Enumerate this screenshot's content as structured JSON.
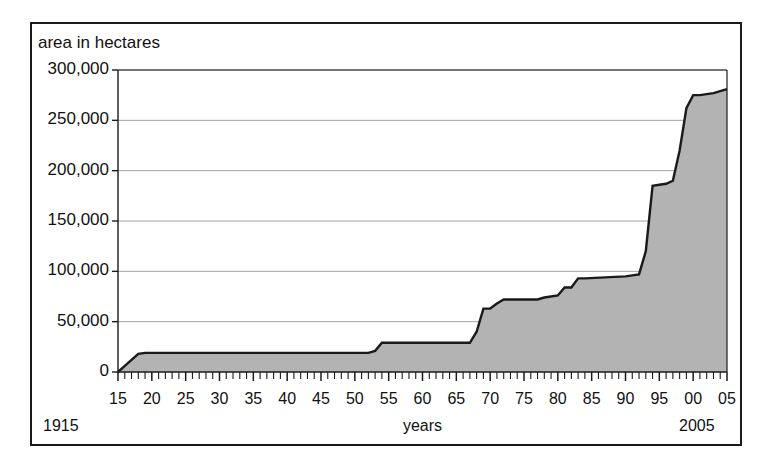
{
  "chart_data": {
    "type": "area",
    "title": "",
    "ylabel": "area in hectares",
    "xlabel": "years",
    "ylim": [
      0,
      300000
    ],
    "xlim": [
      1915,
      2005
    ],
    "grid": true,
    "legend": null,
    "y_ticks": [
      0,
      50000,
      100000,
      150000,
      200000,
      250000,
      300000
    ],
    "y_tick_labels": [
      "0",
      "50,000",
      "100,000",
      "150,000",
      "200,000",
      "250,000",
      "300,000"
    ],
    "x_ticks": [
      1915,
      1920,
      1925,
      1930,
      1935,
      1940,
      1945,
      1950,
      1955,
      1960,
      1965,
      1970,
      1975,
      1980,
      1985,
      1990,
      1995,
      2000,
      2005
    ],
    "x_tick_labels": [
      "15",
      "20",
      "25",
      "30",
      "35",
      "40",
      "45",
      "50",
      "55",
      "60",
      "65",
      "70",
      "75",
      "80",
      "85",
      "90",
      "95",
      "00",
      "05"
    ],
    "x_start_annotation": "1915",
    "x_end_annotation": "2005",
    "minor_tick_interval": 1,
    "fill_color": "#b3b3b3",
    "line_color": "#1a1a1a",
    "x": [
      1915,
      1916,
      1917,
      1918,
      1919,
      1920,
      1925,
      1930,
      1935,
      1940,
      1945,
      1950,
      1952,
      1953,
      1954,
      1960,
      1965,
      1967,
      1968,
      1969,
      1970,
      1971,
      1972,
      1975,
      1977,
      1978,
      1980,
      1981,
      1982,
      1983,
      1984,
      1990,
      1992,
      1993,
      1994,
      1995,
      1996,
      1997,
      1998,
      1999,
      2000,
      2001,
      2002,
      2003,
      2004,
      2005
    ],
    "values": [
      0,
      6000,
      12000,
      18000,
      19000,
      19000,
      19000,
      19000,
      19000,
      19000,
      19000,
      19000,
      19000,
      21000,
      29000,
      29000,
      29000,
      29000,
      40000,
      63000,
      63000,
      68000,
      72000,
      72000,
      72000,
      74000,
      76000,
      84000,
      84000,
      93000,
      93000,
      95000,
      97000,
      120000,
      185000,
      186000,
      187000,
      190000,
      220000,
      262000,
      275000,
      275000,
      276000,
      277000,
      279000,
      281000
    ]
  }
}
